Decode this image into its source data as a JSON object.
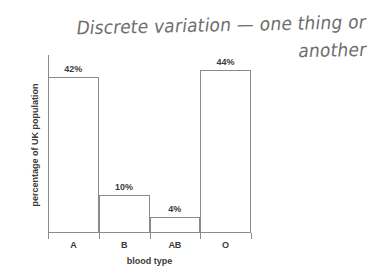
{
  "annotation": {
    "line1": "Discrete variation — one thing or",
    "line2": "another"
  },
  "chart_data": {
    "type": "bar",
    "title": "",
    "categories": [
      "A",
      "B",
      "AB",
      "O"
    ],
    "values": [
      42,
      10,
      4,
      44
    ],
    "value_labels": [
      "42%",
      "10%",
      "4%",
      "44%"
    ],
    "xlabel": "blood type",
    "ylabel": "percentage of UK population",
    "ylim": [
      0,
      48
    ],
    "grid": false,
    "legend": false,
    "bar_style": "outline",
    "colors": {
      "line": "#8a8a8a",
      "text": "#3a3a3a",
      "handwriting": "#6e6e6e",
      "background": "#ffffff"
    }
  }
}
